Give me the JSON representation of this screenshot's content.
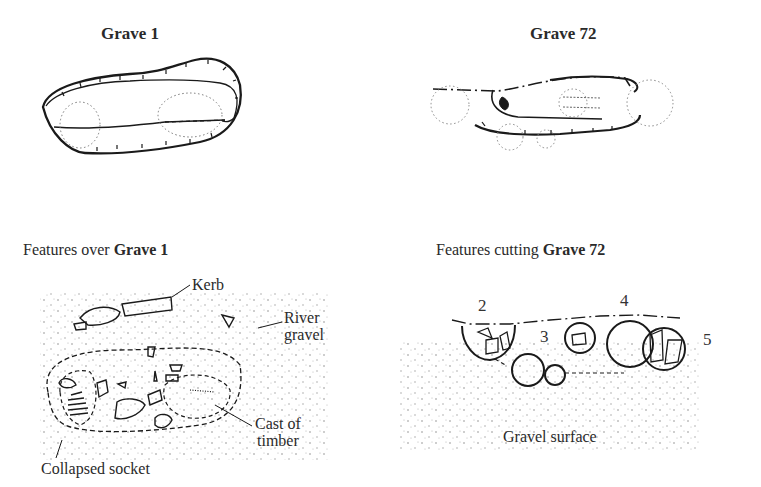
{
  "panels": {
    "grave1": {
      "title": "Grave 1"
    },
    "grave72": {
      "title": "Grave 72"
    },
    "features_grave1": {
      "title_prefix": "Features over ",
      "title_bold": "Grave 1",
      "labels": {
        "kerb": "Kerb",
        "river_gravel_line1": "River",
        "river_gravel_line2": "gravel",
        "cast_line1": "Cast of",
        "cast_line2": "timber",
        "collapsed_socket": "Collapsed socket"
      }
    },
    "features_grave72": {
      "title_prefix": "Features cutting ",
      "title_bold": "Grave 72",
      "feature_numbers": [
        "2",
        "3",
        "4",
        "5"
      ],
      "labels": {
        "gravel_surface": "Gravel surface"
      }
    }
  },
  "colors": {
    "ink": "#1a1a1a",
    "background": "#ffffff"
  }
}
